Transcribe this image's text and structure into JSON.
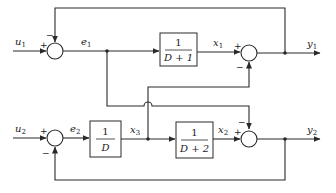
{
  "diagram": {
    "type": "block-diagram",
    "inputs": [
      {
        "id": "u1",
        "base": "u",
        "sub": "1"
      },
      {
        "id": "u2",
        "base": "u",
        "sub": "2"
      }
    ],
    "outputs": [
      {
        "id": "y1",
        "base": "y",
        "sub": "1"
      },
      {
        "id": "y2",
        "base": "y",
        "sub": "2"
      }
    ],
    "signals": {
      "e1": {
        "base": "e",
        "sub": "1"
      },
      "e2": {
        "base": "e",
        "sub": "2"
      },
      "x1": {
        "base": "x",
        "sub": "1"
      },
      "x2": {
        "base": "x",
        "sub": "2"
      },
      "x3": {
        "base": "x",
        "sub": "3"
      }
    },
    "blocks": [
      {
        "id": "block-top",
        "numerator": "1",
        "denominator": "D + 1",
        "input": "e1",
        "output": "x1"
      },
      {
        "id": "block-integrator",
        "numerator": "1",
        "denominator": "D",
        "input": "e2",
        "output": "x3"
      },
      {
        "id": "block-bottom",
        "numerator": "1",
        "denominator": "D + 2",
        "input": "x3",
        "output": "x2"
      }
    ],
    "summers": [
      {
        "id": "sum-e1",
        "inputs": [
          {
            "from": "u1",
            "sign": "+"
          },
          {
            "from": "y1",
            "sign": "−"
          }
        ],
        "output": "e1"
      },
      {
        "id": "sum-y1",
        "inputs": [
          {
            "from": "x1",
            "sign": "+"
          },
          {
            "from": "x3",
            "sign": "−"
          }
        ],
        "output": "y1"
      },
      {
        "id": "sum-e2",
        "inputs": [
          {
            "from": "u2",
            "sign": "+"
          },
          {
            "from": "y2",
            "sign": "−"
          }
        ],
        "output": "e2"
      },
      {
        "id": "sum-y2",
        "inputs": [
          {
            "from": "x2",
            "sign": "+"
          },
          {
            "from": "e1",
            "sign": "−"
          }
        ],
        "output": "y2"
      }
    ],
    "signs": {
      "plus": "+",
      "minus": "−"
    }
  }
}
